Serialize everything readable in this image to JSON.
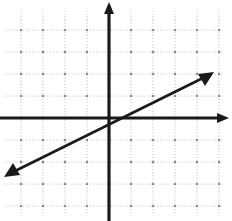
{
  "figure": {
    "name": "coordinate-plane-with-line",
    "width": 232,
    "height": 221,
    "background_color": "#ffffff",
    "title": "",
    "caption": ""
  },
  "axes": {
    "origin_px": {
      "x": 109,
      "y": 118
    },
    "grid_spacing_px": 22,
    "x_axis": {
      "label": "",
      "color": "#1a1a1a",
      "arrow_end": "right",
      "start_px": {
        "x": 0,
        "y": 118
      },
      "end_px": {
        "x": 229,
        "y": 118
      }
    },
    "y_axis": {
      "label": "",
      "color": "#1a1a1a",
      "arrow_end": "top",
      "start_px": {
        "x": 109,
        "y": 221
      },
      "end_px": {
        "x": 109,
        "y": 2
      }
    },
    "grid": {
      "style": "dotted",
      "color": "#b9b9b9",
      "node_color": "#8d8d8d",
      "left_px": 5,
      "right_px": 222,
      "top_px": 11,
      "bottom_px": 215
    },
    "tick_labels_visible": false,
    "axis_numbers_visible": false
  },
  "chart_data": {
    "type": "line",
    "title": "",
    "xlabel": "",
    "ylabel": "",
    "grid": true,
    "legend_position": "none",
    "xlim": [
      -4.7,
      5.6
    ],
    "ylim": [
      -4.7,
      4.9
    ],
    "x_tick_step": 1,
    "y_tick_step": 1,
    "annotations": [],
    "series": [
      {
        "name": "line",
        "equation": "y = 0.5x",
        "slope": 0.5,
        "intercept": 0,
        "color": "#1a1a1a",
        "arrows": "both",
        "x": [
          -4.7,
          4.7
        ],
        "values": [
          -2.35,
          2.35
        ],
        "endpoints_px": [
          {
            "x": 5,
            "y": 176
          },
          {
            "x": 213,
            "y": 73
          }
        ]
      }
    ]
  }
}
